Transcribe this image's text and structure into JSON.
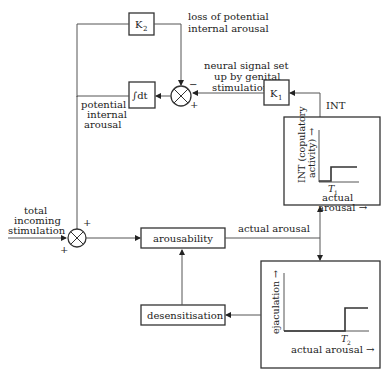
{
  "diagram": {
    "blocks": {
      "k2": {
        "label": "K",
        "sub": "2"
      },
      "k1": {
        "label": "K",
        "sub": "1"
      },
      "integrator": {
        "label": "∫dt"
      },
      "arousability": {
        "label": "arousability"
      },
      "desensitisation": {
        "label": "desensitisation"
      }
    },
    "labels": {
      "loss_line1": "loss of potential",
      "loss_line2": "internal arousal",
      "neural_line1": "neural signal set",
      "neural_line2": "up by genital",
      "neural_line3": "stimulation",
      "potential_line1": "potential",
      "potential_line2": "internal",
      "potential_line3": "arousal",
      "int": "INT",
      "total_line1": "total",
      "total_line2": "incoming",
      "total_line3": "stimulation",
      "actual_arousal": "actual arousal"
    },
    "signs": {
      "upper_minus": "−",
      "upper_plus": "+",
      "lower_top_plus": "+",
      "lower_bottom_plus": "+"
    },
    "graph_int": {
      "ylabel_line1": "INT (copulatory",
      "ylabel_line2": "activity) →",
      "threshold": "T",
      "threshold_sub": "1",
      "xlabel_line1": "actual",
      "xlabel_line2": "arousal →"
    },
    "graph_ejac": {
      "ylabel": "ejaculation →",
      "threshold": "T",
      "threshold_sub": "2",
      "xlabel": "actual arousal →"
    }
  }
}
